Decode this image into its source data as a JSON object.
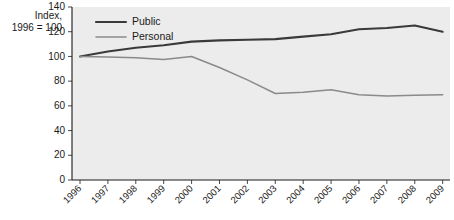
{
  "chart_data": {
    "type": "line",
    "title": "",
    "subtitle": "",
    "ylabel": "Index,\n1996 = 100",
    "ylabel_line1": "Index,",
    "ylabel_line2": "1996 = 100",
    "xlabel": "",
    "ylim": [
      0,
      140
    ],
    "yticks": [
      0,
      20,
      40,
      60,
      80,
      100,
      120,
      140
    ],
    "ytick_labels": [
      "0",
      "20",
      "40",
      "60",
      "80",
      "100",
      "120",
      "140"
    ],
    "grid": false,
    "legend_position": "top-left-inside",
    "categories": [
      "1996",
      "1997",
      "1998",
      "1999",
      "2000",
      "2001",
      "2002",
      "2003",
      "2004",
      "2005",
      "2006",
      "2007",
      "2008",
      "2009"
    ],
    "series": [
      {
        "name": "Public",
        "color": "#3a3a3a",
        "values": [
          100,
          104,
          107,
          109,
          112,
          113,
          113.5,
          114,
          116,
          118,
          122,
          123,
          125,
          120
        ]
      },
      {
        "name": "Personal",
        "color": "#8a8a8a",
        "values": [
          100,
          99.5,
          99,
          97.5,
          100,
          91,
          81,
          70,
          71,
          73,
          69,
          68,
          68.5,
          69
        ]
      }
    ]
  },
  "legend": {
    "items": [
      {
        "label": "Public",
        "color": "#3a3a3a"
      },
      {
        "label": "Personal",
        "color": "#8a8a8a"
      }
    ]
  },
  "colors": {
    "plot_background": "#ececec",
    "axis": "#1a1a1a",
    "text": "#1a1a1a",
    "public_line": "#3a3a3a",
    "personal_line": "#8a8a8a"
  }
}
